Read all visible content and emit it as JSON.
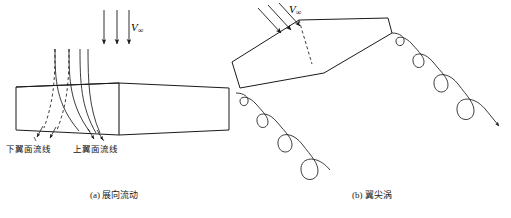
{
  "figure": {
    "background_color": "#ffffff",
    "line_color": "#1a1a1a",
    "panels": [
      {
        "id": "a",
        "caption": "(a) 展向流动",
        "freestream_label": "V",
        "freestream_subscript": "∞",
        "labels": [
          {
            "name": "lower-surface-streamline",
            "text": "下翼面流线"
          },
          {
            "name": "upper-surface-streamline",
            "text": "上翼面流线"
          }
        ]
      },
      {
        "id": "b",
        "caption": "(b) 翼尖涡",
        "freestream_label": "V",
        "freestream_subscript": "∞"
      }
    ]
  }
}
